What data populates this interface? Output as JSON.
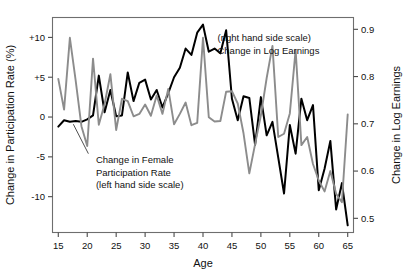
{
  "chart_data": {
    "type": "line",
    "title": "",
    "xlabel": "Age",
    "ylabel": "Change in Participation Rate (%)",
    "y2label": "Change in Log Earnings",
    "xlim": [
      14,
      66
    ],
    "ylim": [
      -14.5,
      12.5
    ],
    "y2lim": [
      0.47,
      0.925
    ],
    "grid": false,
    "legend_position": "inline-annotations",
    "xticks": [
      15,
      20,
      25,
      30,
      35,
      40,
      45,
      50,
      55,
      60,
      65
    ],
    "xticklabels": [
      "15",
      "20",
      "25",
      "30",
      "35",
      "40",
      "45",
      "50",
      "55",
      "60",
      "65"
    ],
    "yticks": [
      10,
      5,
      0,
      -5,
      -10
    ],
    "yticklabels": [
      "+10",
      "+5",
      "0",
      "-5",
      "-10"
    ],
    "y2ticks": [
      0.9,
      0.8,
      0.7,
      0.6,
      0.5
    ],
    "y2ticklabels": [
      "0.9",
      "0.8",
      "0.7",
      "0.6",
      "0.5"
    ],
    "annotations": [
      {
        "name": "log-earnings-annotation",
        "lines": [
          "(right hand side scale)",
          "Change in Log Earnings"
        ],
        "x": 42.5,
        "y": 9.5
      },
      {
        "name": "participation-annotation",
        "lines": [
          "Change in Female",
          "Participation Rate",
          "(left hand side scale)"
        ],
        "x": 21.5,
        "y": -5.8
      }
    ],
    "x": [
      15,
      16,
      17,
      18,
      19,
      20,
      21,
      22,
      23,
      24,
      25,
      26,
      27,
      28,
      29,
      30,
      31,
      32,
      33,
      34,
      35,
      36,
      37,
      38,
      39,
      40,
      41,
      42,
      43,
      44,
      45,
      46,
      47,
      48,
      49,
      50,
      51,
      52,
      53,
      54,
      55,
      56,
      57,
      58,
      59,
      60,
      61,
      62,
      63,
      64,
      65
    ],
    "series": [
      {
        "name": "Change in Female Participation Rate",
        "axis": "left",
        "color": "#000000",
        "values": [
          -1.2,
          -0.4,
          -0.6,
          -0.5,
          -0.6,
          -0.3,
          0.2,
          5.2,
          0.6,
          3.4,
          0.1,
          0.2,
          5.6,
          2.0,
          4.3,
          4.7,
          2.2,
          3.4,
          1.2,
          3.0,
          5.0,
          6.2,
          8.6,
          7.8,
          10.6,
          11.6,
          8.2,
          8.6,
          8.0,
          10.9,
          2.3,
          -0.4,
          2.6,
          2.4,
          -3.5,
          2.5,
          -2.3,
          -0.6,
          -5.1,
          -9.6,
          -1.0,
          -4.6,
          2.3,
          -0.4,
          1.5,
          -9.2,
          -6.5,
          -3.0,
          -11.6,
          -8.3,
          -13.6
        ]
      },
      {
        "name": "Change in Log Earnings",
        "axis": "right",
        "color": "#8c8c8c",
        "values": [
          0.795,
          0.73,
          0.882,
          0.792,
          0.695,
          0.653,
          0.838,
          0.698,
          0.742,
          0.805,
          0.687,
          0.753,
          0.748,
          0.716,
          0.721,
          0.741,
          0.717,
          0.76,
          0.721,
          0.774,
          0.699,
          0.721,
          0.745,
          0.697,
          0.702,
          0.882,
          0.714,
          0.705,
          0.706,
          0.768,
          0.769,
          0.743,
          0.68,
          0.595,
          0.657,
          0.718,
          0.797,
          0.865,
          0.672,
          0.679,
          0.722,
          0.856,
          0.655,
          0.672,
          0.615,
          0.58,
          0.557,
          0.6,
          0.552,
          0.534,
          0.72
        ]
      }
    ]
  }
}
